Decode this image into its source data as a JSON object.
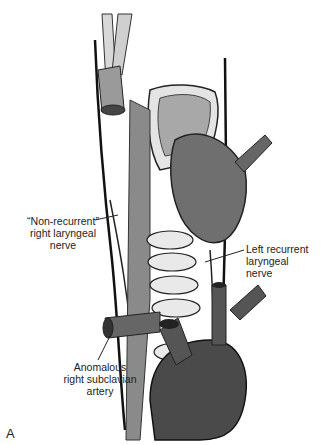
{
  "figure": {
    "panel_label": "A",
    "labels": [
      {
        "id": "non-recurrent-nerve",
        "lines": [
          "“Non-recurrent”",
          "right laryngeal",
          "nerve"
        ]
      },
      {
        "id": "left-recurrent-nerve",
        "lines": [
          "Left recurrent",
          "laryngeal",
          "nerve"
        ]
      },
      {
        "id": "anomalous-subclavian",
        "lines": [
          "Anomalous",
          "right subclavian",
          "artery"
        ]
      }
    ]
  }
}
